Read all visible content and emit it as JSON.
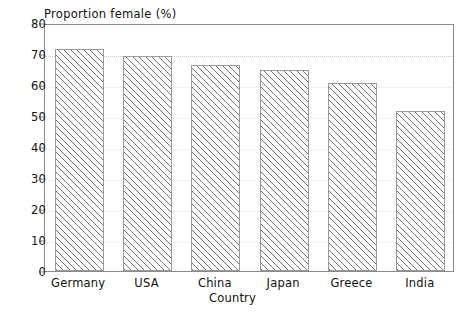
{
  "chart_data": {
    "type": "bar",
    "title": "Proportion female (%)",
    "xlabel": "Country",
    "ylabel": "",
    "categories": [
      "Germany",
      "USA",
      "China",
      "Japan",
      "Greece",
      "India"
    ],
    "values": [
      71.5,
      69.3,
      66.3,
      64.8,
      60.6,
      51.6
    ],
    "ylim": [
      0,
      80
    ],
    "yticks": [
      0,
      10,
      20,
      30,
      40,
      50,
      60,
      70,
      80
    ],
    "ytick_labels": [
      "0",
      "10",
      "20",
      "30",
      "40",
      "50",
      "60",
      "70",
      "80"
    ],
    "grid": true,
    "legend": "none",
    "bar_style": {
      "fill": "#ffffff",
      "hatch": "diagonal-45",
      "hatch_color": "#5a5a5a",
      "edge_color": "#9a9a9a"
    },
    "frame_color": "#8a8a8a",
    "gridline_color": "#f2f2f2",
    "reference_line": {
      "value": 70,
      "style": "dotted",
      "color": "#c8c8c8"
    }
  }
}
